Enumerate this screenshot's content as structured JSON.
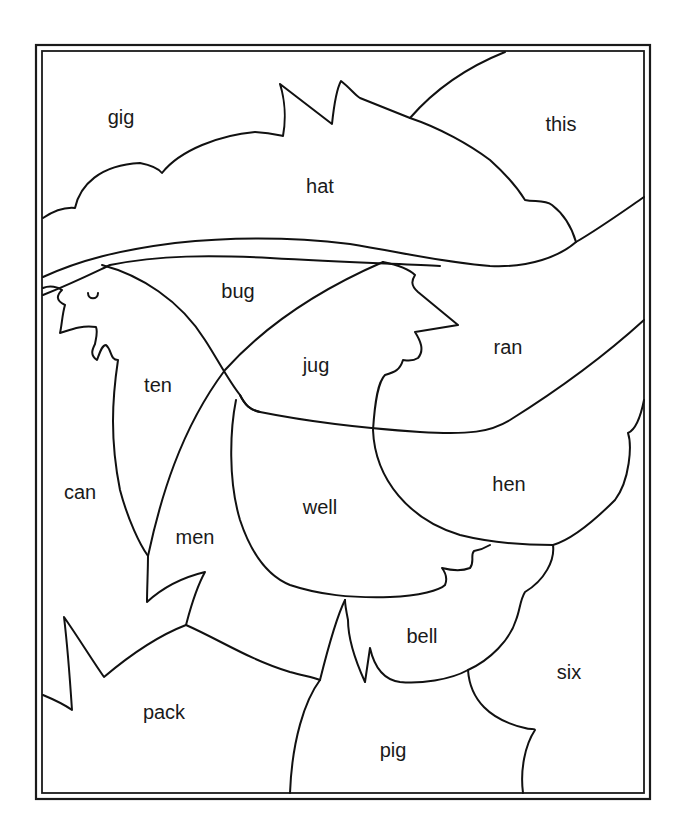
{
  "worksheet": {
    "subject": "hen wearing a hat",
    "colors": {
      "line": "#111111",
      "background": "#ffffff"
    },
    "regions": [
      {
        "id": "gig",
        "label": "gig"
      },
      {
        "id": "hat",
        "label": "hat"
      },
      {
        "id": "this",
        "label": "this"
      },
      {
        "id": "bug",
        "label": "bug"
      },
      {
        "id": "jug",
        "label": "jug"
      },
      {
        "id": "ran",
        "label": "ran"
      },
      {
        "id": "ten",
        "label": "ten"
      },
      {
        "id": "can",
        "label": "can"
      },
      {
        "id": "well",
        "label": "well"
      },
      {
        "id": "hen",
        "label": "hen"
      },
      {
        "id": "men",
        "label": "men"
      },
      {
        "id": "bell",
        "label": "bell"
      },
      {
        "id": "six",
        "label": "six"
      },
      {
        "id": "pack",
        "label": "pack"
      },
      {
        "id": "pig",
        "label": "pig"
      }
    ]
  }
}
